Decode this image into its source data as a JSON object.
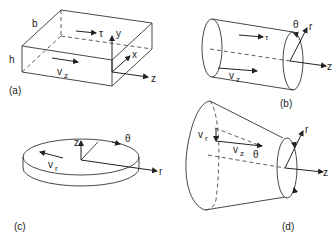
{
  "panels": {
    "a": {
      "caption": "(a)",
      "shape": "rectangular slab",
      "labels": {
        "b": "b",
        "h": "h",
        "tau": "τ",
        "y": "y",
        "x": "x",
        "z": "z",
        "vz": "v",
        "vz_sub": "z"
      }
    },
    "b": {
      "caption": "(b)",
      "shape": "cylinder",
      "labels": {
        "tau": "τ",
        "theta": "θ",
        "r": "r",
        "z": "z",
        "vz": "v",
        "vz_sub": "z"
      }
    },
    "c": {
      "caption": "(c)",
      "shape": "disk",
      "labels": {
        "z": "z",
        "theta": "θ",
        "r": "r",
        "vr": "v",
        "vr_sub": "r"
      }
    },
    "d": {
      "caption": "(d)",
      "shape": "truncated cone",
      "labels": {
        "vr": "v",
        "vr_sub": "r",
        "vz": "v",
        "vz_sub": "z",
        "theta": "θ",
        "r": "r",
        "z": "z"
      }
    }
  }
}
